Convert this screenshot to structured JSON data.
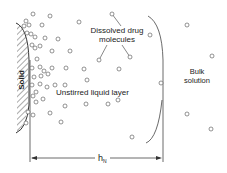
{
  "diagram": {
    "labels": {
      "solid": "Solid",
      "dissolved_line1": "Dissolved drug",
      "dissolved_line2": "molecules",
      "unstirred": "Unstirred liquid layer",
      "bulk_line1": "Bulk",
      "bulk_line2": "solution",
      "thickness_h": "h",
      "thickness_sub": "N"
    },
    "colors": {
      "stroke": "#444444",
      "text": "#222222",
      "molecule": "#666666",
      "hatch": "#555555"
    },
    "molecules": [
      [
        33,
        14
      ],
      [
        50,
        16
      ],
      [
        26,
        21
      ],
      [
        29,
        25
      ],
      [
        24,
        26
      ],
      [
        42,
        25
      ],
      [
        79,
        22
      ],
      [
        27,
        33
      ],
      [
        31,
        34
      ],
      [
        35,
        37
      ],
      [
        45,
        38
      ],
      [
        58,
        39
      ],
      [
        32,
        45
      ],
      [
        35,
        48
      ],
      [
        40,
        46
      ],
      [
        52,
        51
      ],
      [
        70,
        51
      ],
      [
        37,
        59
      ],
      [
        32,
        68
      ],
      [
        40,
        67
      ],
      [
        44,
        71
      ],
      [
        52,
        68
      ],
      [
        66,
        68
      ],
      [
        84,
        69
      ],
      [
        34,
        77
      ],
      [
        41,
        76
      ],
      [
        48,
        74
      ],
      [
        87,
        80
      ],
      [
        32,
        85
      ],
      [
        40,
        84
      ],
      [
        36,
        92
      ],
      [
        47,
        87
      ],
      [
        55,
        85
      ],
      [
        65,
        85
      ],
      [
        33,
        96
      ],
      [
        36,
        102
      ],
      [
        43,
        99
      ],
      [
        65,
        106
      ],
      [
        86,
        104
      ],
      [
        108,
        104
      ],
      [
        28,
        112
      ],
      [
        33,
        115
      ],
      [
        50,
        113
      ],
      [
        26,
        123
      ],
      [
        61,
        122
      ],
      [
        112,
        14
      ],
      [
        150,
        35
      ],
      [
        130,
        57
      ],
      [
        99,
        60
      ],
      [
        119,
        69
      ],
      [
        161,
        83
      ],
      [
        118,
        100
      ],
      [
        132,
        137
      ],
      [
        187,
        25
      ],
      [
        212,
        56
      ],
      [
        187,
        114
      ],
      [
        211,
        129
      ]
    ],
    "leaders": [
      {
        "from": [
          112,
          14
        ],
        "to": [
          121,
          26
        ]
      },
      {
        "from": [
          99,
          60
        ],
        "to": [
          107,
          45
        ]
      },
      {
        "from": [
          130,
          57
        ],
        "to": [
          122,
          45
        ]
      }
    ]
  }
}
